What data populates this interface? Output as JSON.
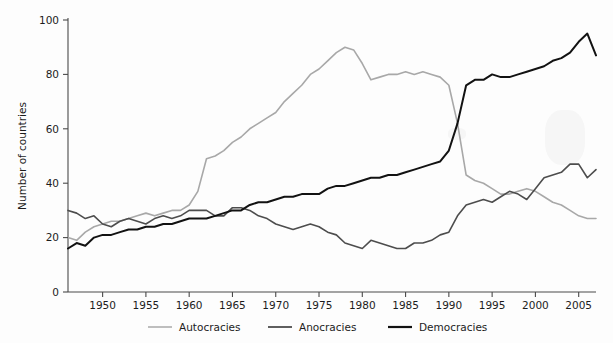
{
  "chart_data": {
    "type": "line",
    "title": "",
    "xlabel": "",
    "ylabel": "Number of countries",
    "xlim": [
      1946,
      2007
    ],
    "ylim": [
      0,
      100
    ],
    "grid": false,
    "legend_position": "bottom",
    "xticks": [
      1950,
      1955,
      1960,
      1965,
      1970,
      1975,
      1980,
      1985,
      1990,
      1995,
      2000,
      2005
    ],
    "xtick_labels": [
      "1950",
      "1955",
      "1960",
      "1965",
      "1970",
      "1975",
      "1980",
      "1985",
      "1990",
      "1995",
      "2000",
      "2005"
    ],
    "yticks": [
      0,
      20,
      40,
      60,
      80,
      100
    ],
    "ytick_labels": [
      "0",
      "20",
      "40",
      "60",
      "80",
      "100"
    ],
    "x": [
      1946,
      1947,
      1948,
      1949,
      1950,
      1951,
      1952,
      1953,
      1954,
      1955,
      1956,
      1957,
      1958,
      1959,
      1960,
      1961,
      1962,
      1963,
      1964,
      1965,
      1966,
      1967,
      1968,
      1969,
      1970,
      1971,
      1972,
      1973,
      1974,
      1975,
      1976,
      1977,
      1978,
      1979,
      1980,
      1981,
      1982,
      1983,
      1984,
      1985,
      1986,
      1987,
      1988,
      1989,
      1990,
      1991,
      1992,
      1993,
      1994,
      1995,
      1996,
      1997,
      1998,
      1999,
      2000,
      2001,
      2002,
      2003,
      2004,
      2005,
      2006,
      2007
    ],
    "series": [
      {
        "name": "Autocracies",
        "color": "#a8a8a8",
        "width": 1.6,
        "values": [
          20,
          19,
          22,
          24,
          25,
          26,
          26,
          27,
          28,
          29,
          28,
          29,
          30,
          30,
          32,
          37,
          49,
          50,
          52,
          55,
          57,
          60,
          62,
          64,
          66,
          70,
          73,
          76,
          80,
          82,
          85,
          88,
          90,
          89,
          84,
          78,
          79,
          80,
          80,
          81,
          80,
          81,
          80,
          79,
          76,
          62,
          43,
          41,
          40,
          38,
          36,
          36,
          37,
          38,
          37,
          35,
          33,
          32,
          30,
          28,
          27,
          27
        ]
      },
      {
        "name": "Anocracies",
        "color": "#4d4d4d",
        "width": 1.6,
        "values": [
          30,
          29,
          27,
          28,
          25,
          24,
          26,
          27,
          26,
          25,
          27,
          28,
          27,
          28,
          30,
          30,
          30,
          28,
          28,
          31,
          31,
          30,
          28,
          27,
          25,
          24,
          23,
          24,
          25,
          24,
          22,
          21,
          18,
          17,
          16,
          19,
          18,
          17,
          16,
          16,
          18,
          18,
          19,
          21,
          22,
          28,
          32,
          33,
          34,
          33,
          35,
          37,
          36,
          34,
          38,
          42,
          43,
          44,
          47,
          47,
          42,
          45
        ]
      },
      {
        "name": "Democracies",
        "color": "#121212",
        "width": 2.0,
        "values": [
          16,
          18,
          17,
          20,
          21,
          21,
          22,
          23,
          23,
          24,
          24,
          25,
          25,
          26,
          27,
          27,
          27,
          28,
          29,
          30,
          30,
          32,
          33,
          33,
          34,
          35,
          35,
          36,
          36,
          36,
          38,
          39,
          39,
          40,
          41,
          42,
          42,
          43,
          43,
          44,
          45,
          46,
          47,
          48,
          52,
          62,
          76,
          78,
          78,
          80,
          79,
          79,
          80,
          81,
          82,
          83,
          85,
          86,
          88,
          92,
          95,
          87
        ]
      }
    ]
  },
  "legend": {
    "items": [
      {
        "label": "Autocracies",
        "color": "#a8a8a8"
      },
      {
        "label": "Anocracies",
        "color": "#4d4d4d"
      },
      {
        "label": "Democracies",
        "color": "#121212"
      }
    ]
  }
}
